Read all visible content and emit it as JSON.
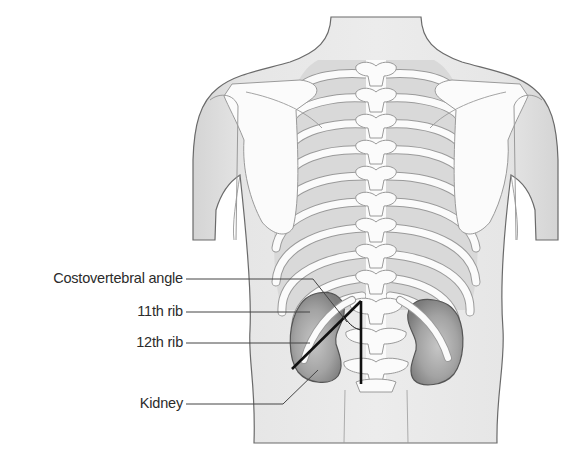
{
  "figure": {
    "type": "anatomical illustration",
    "view": "posterior torso",
    "colors": {
      "skin": "#e3e3e3",
      "skin_outline": "#6a6a6a",
      "bone": "#fbfbfb",
      "bone_outline": "#9a9a9a",
      "kidney": "#9c9c9c",
      "kidney_outline": "#555555",
      "marker_lines": "#111111",
      "leader_lines": "#444444",
      "label_text": "#2b2b2b"
    }
  },
  "labels": [
    {
      "id": "costovertebral-angle",
      "text": "Costovertebral angle"
    },
    {
      "id": "11th-rib",
      "text": "11th rib"
    },
    {
      "id": "12th-rib",
      "text": "12th rib"
    },
    {
      "id": "kidney",
      "text": "Kidney"
    }
  ]
}
